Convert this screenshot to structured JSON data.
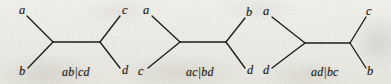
{
  "figure": {
    "name": "three-unrooted-quartet-trees",
    "background_color": "#efeee8",
    "ink_color": "#1b1b1b",
    "width": 391,
    "height": 84,
    "trees": [
      {
        "id": "tree-ab-cd",
        "caption": "ab|cd",
        "caption_x": 62,
        "caption_y": 66,
        "internal_edge": {
          "x1": 53,
          "y1": 42,
          "x2": 100,
          "y2": 42
        },
        "leaves": [
          {
            "label": "a",
            "label_x": 19,
            "label_y": 4,
            "tip_x": 27,
            "tip_y": 16,
            "node_x": 53,
            "node_y": 42
          },
          {
            "label": "b",
            "label_x": 19,
            "label_y": 65,
            "tip_x": 28,
            "tip_y": 68,
            "node_x": 53,
            "node_y": 42
          },
          {
            "label": "c",
            "label_x": 122,
            "label_y": 4,
            "tip_x": 120,
            "tip_y": 16,
            "node_x": 100,
            "node_y": 42
          },
          {
            "label": "d",
            "label_x": 122,
            "label_y": 64,
            "tip_x": 120,
            "tip_y": 68,
            "node_x": 100,
            "node_y": 42
          }
        ]
      },
      {
        "id": "tree-ac-bd",
        "caption": "ac|bd",
        "caption_x": 186,
        "caption_y": 66,
        "internal_edge": {
          "x1": 180,
          "y1": 42,
          "x2": 226,
          "y2": 42
        },
        "leaves": [
          {
            "label": "a",
            "label_x": 143,
            "label_y": 4,
            "tip_x": 152,
            "tip_y": 16,
            "node_x": 180,
            "node_y": 42
          },
          {
            "label": "c",
            "label_x": 138,
            "label_y": 65,
            "tip_x": 148,
            "tip_y": 68,
            "node_x": 180,
            "node_y": 42
          },
          {
            "label": "b",
            "label_x": 246,
            "label_y": 6,
            "tip_x": 245,
            "tip_y": 18,
            "node_x": 226,
            "node_y": 42
          },
          {
            "label": "d",
            "label_x": 247,
            "label_y": 64,
            "tip_x": 245,
            "tip_y": 68,
            "node_x": 226,
            "node_y": 42
          }
        ]
      },
      {
        "id": "tree-ad-bc",
        "caption": "ad|bc",
        "caption_x": 311,
        "caption_y": 66,
        "internal_edge": {
          "x1": 305,
          "y1": 43,
          "x2": 350,
          "y2": 43
        },
        "leaves": [
          {
            "label": "a",
            "label_x": 263,
            "label_y": 5,
            "tip_x": 272,
            "tip_y": 17,
            "node_x": 305,
            "node_y": 43
          },
          {
            "label": "d",
            "label_x": 263,
            "label_y": 64,
            "tip_x": 272,
            "tip_y": 68,
            "node_x": 305,
            "node_y": 43
          },
          {
            "label": "c",
            "label_x": 366,
            "label_y": 5,
            "tip_x": 366,
            "tip_y": 17,
            "node_x": 350,
            "node_y": 43
          },
          {
            "label": "b",
            "label_x": 367,
            "label_y": 65,
            "tip_x": 366,
            "tip_y": 68,
            "node_x": 350,
            "node_y": 43
          }
        ]
      }
    ]
  }
}
